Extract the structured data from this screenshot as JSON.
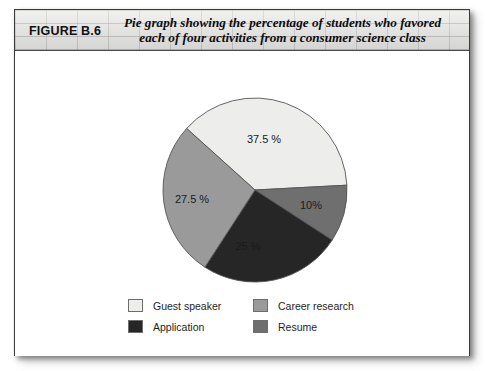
{
  "figure": {
    "number_label": "FIGURE B.6",
    "caption_line1": "Pie graph showing the percentage of students who favored",
    "caption_line2": "each of four activities from a consumer science class"
  },
  "colors": {
    "guest_speaker": "#ededeb",
    "career_research": "#9a9a9a",
    "application": "#262626",
    "resume": "#6f6f6f",
    "slice_outline": "#555555",
    "box_border": "#3a3a3a",
    "caption_band": "#e2e2e0",
    "text": "#1a1a1a",
    "label_light": "#ffffff"
  },
  "chart_data": {
    "type": "pie",
    "title": "Pie graph showing the percentage of students who favored each of four activities from a consumer science class",
    "categories": [
      "Guest speaker",
      "Career research",
      "Application",
      "Resume"
    ],
    "values": [
      37.5,
      27.5,
      25,
      10
    ],
    "value_labels": [
      "37.5 %",
      "27.5 %",
      "25 %",
      "10%"
    ],
    "slices": [
      {
        "name": "Guest speaker",
        "value": 37.5,
        "label": "37.5 %",
        "color": "#ededeb",
        "label_color": "#1a1a1a",
        "start_angle": -48,
        "end_angle": 87,
        "label_x": 249,
        "label_y": 92,
        "label_anchor": "middle"
      },
      {
        "name": "Resume",
        "value": 10,
        "label": "10%",
        "color": "#6f6f6f",
        "label_color": "#ffffff",
        "start_angle": 87,
        "end_angle": 123,
        "label_x": 296,
        "label_y": 158,
        "label_anchor": "middle"
      },
      {
        "name": "Application",
        "value": 25,
        "label": "25 %",
        "color": "#262626",
        "label_color": "#ffffff",
        "start_angle": 123,
        "end_angle": 213,
        "label_x": 233,
        "label_y": 199,
        "label_anchor": "middle"
      },
      {
        "name": "Career research",
        "value": 27.5,
        "label": "27.5 %",
        "color": "#9a9a9a",
        "label_color": "#1a1a1a",
        "start_angle": 213,
        "end_angle": 312,
        "label_x": 177,
        "label_y": 152,
        "label_anchor": "middle"
      }
    ],
    "center_x": 240,
    "center_y": 139,
    "radius": 92,
    "legend_position": "bottom",
    "grid": false
  },
  "legend": {
    "items": [
      {
        "label": "Guest speaker",
        "color": "#ededeb"
      },
      {
        "label": "Career research",
        "color": "#9a9a9a"
      },
      {
        "label": "Application",
        "color": "#262626"
      },
      {
        "label": "Resume",
        "color": "#6f6f6f"
      }
    ]
  }
}
